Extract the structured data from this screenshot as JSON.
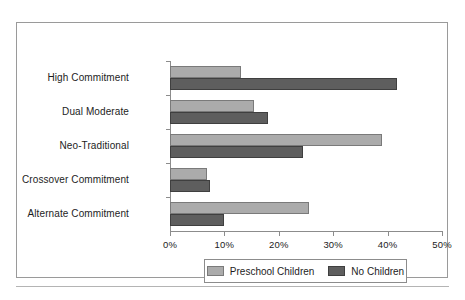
{
  "chart_data": {
    "type": "bar",
    "orientation": "horizontal",
    "title": "",
    "subtitle": "",
    "xlabel": "",
    "ylabel": "",
    "xlim": [
      0,
      50
    ],
    "xtick_labels": [
      "0%",
      "10%",
      "20%",
      "30%",
      "40%",
      "50%"
    ],
    "xticks": [
      0,
      10,
      20,
      30,
      40,
      50
    ],
    "grid": false,
    "legend_position": "bottom",
    "categories": [
      "High Commitment",
      "Dual Moderate",
      "Neo-Traditional",
      "Crossover Commitment",
      "Alternate Commitment"
    ],
    "series": [
      {
        "name": "Preschool Children",
        "color": "#ababab",
        "values": [
          13.0,
          15.5,
          39.0,
          6.8,
          25.5
        ]
      },
      {
        "name": "No Children",
        "color": "#5e5e5e",
        "values": [
          41.7,
          18.0,
          24.5,
          7.3,
          10.0
        ]
      }
    ]
  },
  "legend": {
    "entries": [
      {
        "label": "Preschool Children",
        "swatch": "light-grey-swatch"
      },
      {
        "label": "No Children",
        "swatch": "dark-grey-swatch"
      }
    ]
  },
  "colors": {
    "series_light": "#ababab",
    "series_dark": "#5e5e5e",
    "axis": "#8c8c8c",
    "frame": "#9a9a9a",
    "text": "#1d1d1d",
    "background": "#ffffff"
  }
}
